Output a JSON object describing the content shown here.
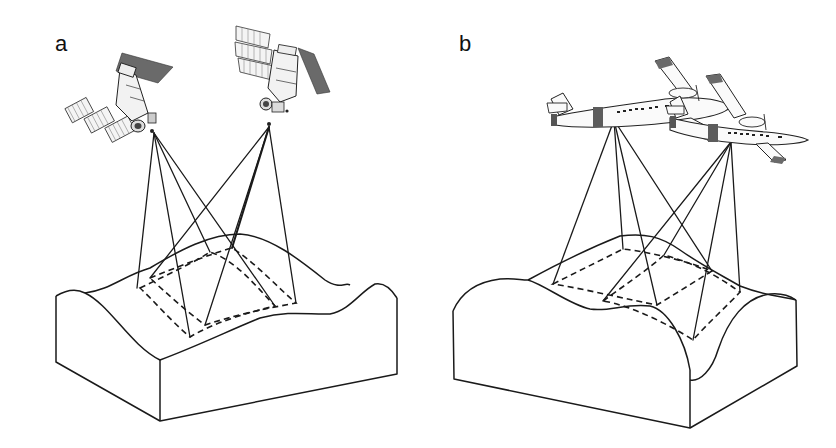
{
  "figure": {
    "panels": [
      {
        "id": "a",
        "label": "a",
        "platform": "satellite",
        "platform_count": 2,
        "icons": [
          "satellite-icon",
          "satellite-icon"
        ],
        "description": "Two satellites imaging an overlapping area of undulating terrain; dashed footprints on surface"
      },
      {
        "id": "b",
        "label": "b",
        "platform": "aircraft",
        "platform_count": 2,
        "icons": [
          "airplane-icon",
          "airplane-icon"
        ],
        "description": "Two twin-engine aircraft imaging an overlapping area of undulating terrain; dashed footprints on surface"
      }
    ],
    "colors": {
      "line": "#1a1a1a",
      "background": "#ffffff",
      "dark_panel": "#6a6a6a"
    }
  }
}
